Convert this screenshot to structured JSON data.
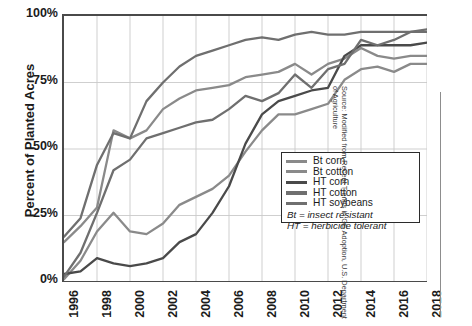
{
  "chart_data": {
    "type": "line",
    "title": "",
    "xlabel": "",
    "ylabel": "Percent of Planted Acres",
    "xlim": [
      1996,
      2018
    ],
    "ylim": [
      0,
      100
    ],
    "grid": true,
    "legend_position": "lower-right inside plot",
    "x": [
      1996,
      1997,
      1998,
      1999,
      2000,
      2001,
      2002,
      2003,
      2004,
      2005,
      2006,
      2007,
      2008,
      2009,
      2010,
      2011,
      2012,
      2013,
      2014,
      2015,
      2016,
      2017,
      2018
    ],
    "xtick_labels": [
      "1996",
      "1998",
      "2000",
      "2002",
      "2004",
      "2006",
      "2008",
      "2010",
      "2012",
      "2014",
      "2016",
      "2018"
    ],
    "ytick_labels": [
      "0%",
      "25%",
      "50%",
      "75%",
      "100%"
    ],
    "ytick_values": [
      0,
      25,
      50,
      75,
      100
    ],
    "series": [
      {
        "name": "Bt corn",
        "color": "#8a8a8a",
        "values": [
          1,
          8,
          19,
          26,
          19,
          18,
          22,
          29,
          32,
          35,
          40,
          49,
          57,
          63,
          63,
          65,
          67,
          76,
          80,
          81,
          79,
          82,
          82
        ]
      },
      {
        "name": "Bt cotton",
        "color": "#8a8a8a",
        "values": [
          15,
          21,
          28,
          57,
          54,
          57,
          65,
          69,
          72,
          73,
          74,
          77,
          78,
          79,
          82,
          78,
          82,
          84,
          88,
          85,
          84,
          85,
          85
        ]
      },
      {
        "name": "HT corn",
        "color": "#4a4a4a",
        "values": [
          3,
          4,
          9,
          7,
          6,
          7,
          9,
          15,
          18,
          26,
          36,
          52,
          63,
          68,
          70,
          72,
          73,
          85,
          89,
          89,
          89,
          89,
          90
        ]
      },
      {
        "name": "HT cotton",
        "color": "#6f6f6f",
        "values": [
          2,
          11,
          26,
          42,
          46,
          54,
          56,
          58,
          60,
          61,
          65,
          70,
          68,
          71,
          78,
          73,
          80,
          82,
          91,
          89,
          91,
          94,
          95
        ]
      },
      {
        "name": "HT soybeans",
        "color": "#6f6f6f",
        "values": [
          17,
          24,
          44,
          56,
          54,
          68,
          75,
          81,
          85,
          87,
          89,
          91,
          92,
          91,
          93,
          94,
          93,
          93,
          94,
          94,
          94,
          94,
          94
        ]
      }
    ],
    "annotations": [
      "Bt = insect resistant",
      "HT = herbicide tolerant"
    ],
    "source": "Source: Modified from Recent Trends in GE Adoption, U.S. Department of Agriculture"
  },
  "axis": {
    "ylabel": "Percent of Planted Acres"
  },
  "legend": {
    "items": [
      {
        "label": "Bt corn",
        "color": "#8a8a8a"
      },
      {
        "label": "Bt cotton",
        "color": "#8a8a8a"
      },
      {
        "label": "HT corn",
        "color": "#4a4a4a"
      },
      {
        "label": "HT cotton",
        "color": "#6f6f6f"
      },
      {
        "label": "HT soybeans",
        "color": "#6f6f6f"
      }
    ],
    "note1": "Bt = insect resistant",
    "note2": "HT = herbicide tolerant"
  },
  "source": {
    "text": "Source: Modified from Recent Trends in GE Adoption, U.S. Department of Agriculture"
  }
}
